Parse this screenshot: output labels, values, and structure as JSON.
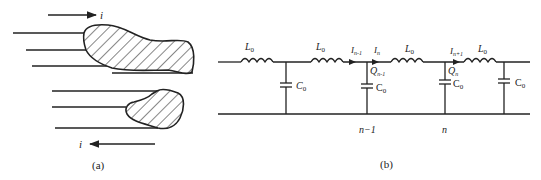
{
  "figure": {
    "panel_a": {
      "caption": "(a)",
      "current_top_label": "i",
      "current_bottom_label": "i",
      "top_arrow_direction": "right",
      "bottom_arrow_direction": "left"
    },
    "panel_b": {
      "caption": "(b)",
      "inductors": [
        {
          "label": "L",
          "sub": "0"
        },
        {
          "label": "L",
          "sub": "0"
        },
        {
          "label": "L",
          "sub": "0"
        },
        {
          "label": "L",
          "sub": "0"
        }
      ],
      "capacitors": [
        {
          "label": "C",
          "sub": "0"
        },
        {
          "label": "C",
          "sub": "0"
        },
        {
          "label": "C",
          "sub": "0"
        },
        {
          "label": "C",
          "sub": "0"
        }
      ],
      "currents": [
        {
          "label": "I",
          "sub": "n-1"
        },
        {
          "label": "I",
          "sub": "n"
        },
        {
          "label": "I",
          "sub": "n+1"
        }
      ],
      "charges": [
        {
          "label": "Q",
          "sub": "n-1"
        },
        {
          "label": "Q",
          "sub": "n"
        }
      ],
      "node_labels": [
        "n−1",
        "n"
      ]
    }
  }
}
